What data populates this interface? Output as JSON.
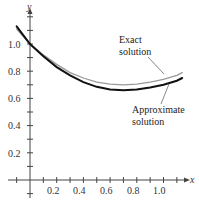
{
  "chart_data": {
    "type": "line",
    "title": "",
    "xlabel": "x",
    "ylabel": "y",
    "xlim": [
      -0.2,
      1.2
    ],
    "ylim": [
      -0.15,
      1.3
    ],
    "x_ticks": [
      "0.2",
      "0.4",
      "0.6",
      "0.8",
      "1.0"
    ],
    "y_ticks": [
      "0.2",
      "0.4",
      "0.6",
      "0.8",
      "1.0"
    ],
    "grid": false,
    "legend": "annotations",
    "series": [
      {
        "name": "Exact solution",
        "color": "#999999",
        "x": [
          -0.1,
          0,
          0.1,
          0.2,
          0.3,
          0.4,
          0.5,
          0.6,
          0.7,
          0.8,
          0.9,
          1.0,
          1.1,
          1.14
        ],
        "y": [
          1.11,
          1.0,
          0.92,
          0.85,
          0.79,
          0.75,
          0.72,
          0.705,
          0.7,
          0.705,
          0.72,
          0.74,
          0.77,
          0.79
        ]
      },
      {
        "name": "Approximate solution",
        "color": "#111111",
        "x": [
          -0.1,
          0,
          0.1,
          0.2,
          0.3,
          0.4,
          0.5,
          0.6,
          0.7,
          0.8,
          0.9,
          1.0,
          1.1,
          1.14
        ],
        "y": [
          1.13,
          1.0,
          0.91,
          0.83,
          0.77,
          0.72,
          0.685,
          0.665,
          0.66,
          0.665,
          0.68,
          0.7,
          0.73,
          0.75
        ]
      }
    ],
    "annotations": [
      {
        "text": [
          "Exact",
          "solution"
        ],
        "points_to": "Exact solution"
      },
      {
        "text": [
          "Approximate",
          "solution"
        ],
        "points_to": "Approximate solution"
      }
    ]
  },
  "labels": {
    "x_axis": "x",
    "y_axis": "y",
    "exact_line1": "Exact",
    "exact_line2": "solution",
    "approx_line1": "Approximate",
    "approx_line2": "solution",
    "xt": [
      "0.2",
      "0.4",
      "0.6",
      "0.8",
      "1.0"
    ],
    "yt": [
      "0.2",
      "0.4",
      "0.6",
      "0.8",
      "1.0"
    ]
  }
}
